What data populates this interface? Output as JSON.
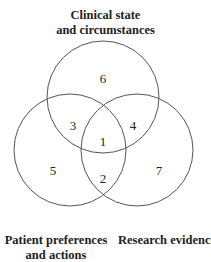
{
  "diagram": {
    "type": "venn",
    "sets": [
      {
        "id": "top",
        "label_line1": "Clinical state",
        "label_line2": "and circumstances"
      },
      {
        "id": "left",
        "label_line1": "Patient preferences",
        "label_line2": "and actions"
      },
      {
        "id": "right",
        "label_line1": "Research evidence",
        "label_line2": ""
      }
    ],
    "regions": [
      {
        "label": "1",
        "sets": [
          "top",
          "left",
          "right"
        ]
      },
      {
        "label": "2",
        "sets": [
          "left",
          "right"
        ]
      },
      {
        "label": "3",
        "sets": [
          "top",
          "left"
        ]
      },
      {
        "label": "4",
        "sets": [
          "top",
          "right"
        ]
      },
      {
        "label": "5",
        "sets": [
          "left"
        ]
      },
      {
        "label": "6",
        "sets": [
          "top"
        ]
      },
      {
        "label": "7",
        "sets": [
          "right"
        ]
      }
    ],
    "stroke_color": "#555555"
  }
}
